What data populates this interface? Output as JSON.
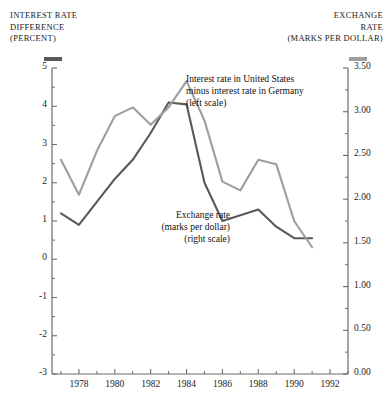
{
  "header": {
    "left": {
      "lines": [
        "INTEREST RATE",
        "DIFFERENCE",
        "(PERCENT)"
      ],
      "swatch_color": "#595959",
      "swatch_name": "interest-rate-legend-swatch"
    },
    "right": {
      "lines": [
        "EXCHANGE",
        "RATE",
        "(MARKS PER DOLLAR)"
      ],
      "swatch_color": "#9e9e9e",
      "swatch_name": "exchange-rate-legend-swatch"
    }
  },
  "annotations": {
    "interest": [
      "Interest rate in United States",
      "minus interest rate in Germany",
      "(left scale)"
    ],
    "exchange": [
      "Exchange rate",
      "(marks per dollar)",
      "(right scale)"
    ]
  },
  "chart_data": {
    "type": "line",
    "title": "",
    "xlabel": "",
    "grid": false,
    "legend": "annotations-inline",
    "x": [
      1977,
      1978,
      1979,
      1980,
      1981,
      1982,
      1983,
      1984,
      1985,
      1986,
      1987,
      1988,
      1989,
      1990,
      1991
    ],
    "xlim": [
      1976.5,
      1993.0
    ],
    "xticks_major": [
      1978,
      1980,
      1982,
      1984,
      1986,
      1988,
      1990,
      1992
    ],
    "xtick_labels": [
      "1978",
      "1980",
      "1982",
      "1984",
      "1986",
      "1988",
      "1990",
      "1992"
    ],
    "xticks_minor": [
      1977,
      1979,
      1981,
      1983,
      1985,
      1987,
      1989,
      1991,
      1993
    ],
    "left_axis": {
      "label": "INTEREST RATE DIFFERENCE (PERCENT)",
      "ylim": [
        -3,
        5
      ],
      "ticks": [
        5,
        4,
        3,
        2,
        1,
        0,
        -1,
        -2,
        -3
      ],
      "tick_labels": [
        "5",
        "4",
        "3",
        "2",
        "1",
        "0",
        "-1",
        "-2",
        "-3"
      ],
      "minor_step": 0.5
    },
    "right_axis": {
      "label": "EXCHANGE RATE (MARKS PER DOLLAR)",
      "ylim": [
        0.0,
        3.5
      ],
      "ticks": [
        3.5,
        3.0,
        2.5,
        2.0,
        1.5,
        1.0,
        0.5,
        0.0
      ],
      "tick_labels": [
        "3.50",
        "3.00",
        "2.50",
        "2.00",
        "1.50",
        "1.00",
        "0.50",
        "0.00"
      ],
      "minor_step": 0.25
    },
    "series": [
      {
        "name": "Interest rate in United States minus interest rate in Germany",
        "axis": "left",
        "color": "#595959",
        "values": [
          1.2,
          0.9,
          1.5,
          2.1,
          2.6,
          3.3,
          4.1,
          4.05,
          2.0,
          1.0,
          1.15,
          1.3,
          0.85,
          0.55,
          0.55
        ]
      },
      {
        "name": "Exchange rate (marks per dollar)",
        "axis": "right",
        "color": "#9e9e9e",
        "values": [
          2.45,
          2.05,
          2.55,
          2.95,
          3.05,
          2.85,
          3.05,
          3.35,
          2.9,
          2.2,
          2.1,
          2.45,
          2.4,
          1.75,
          1.45
        ]
      }
    ]
  }
}
